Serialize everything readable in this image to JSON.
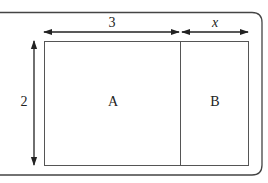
{
  "diagram": {
    "type": "area-model-rectangle",
    "regions": [
      {
        "id": "A",
        "label": "A",
        "width": "3",
        "height": "2"
      },
      {
        "id": "B",
        "label": "B",
        "width": "x",
        "height": "2"
      }
    ],
    "dimensions": {
      "top_left_width": "3",
      "top_right_width": "x",
      "left_height": "2"
    },
    "colors": {
      "stroke": "#333333",
      "frame": "#444444",
      "background": "#ffffff"
    }
  }
}
